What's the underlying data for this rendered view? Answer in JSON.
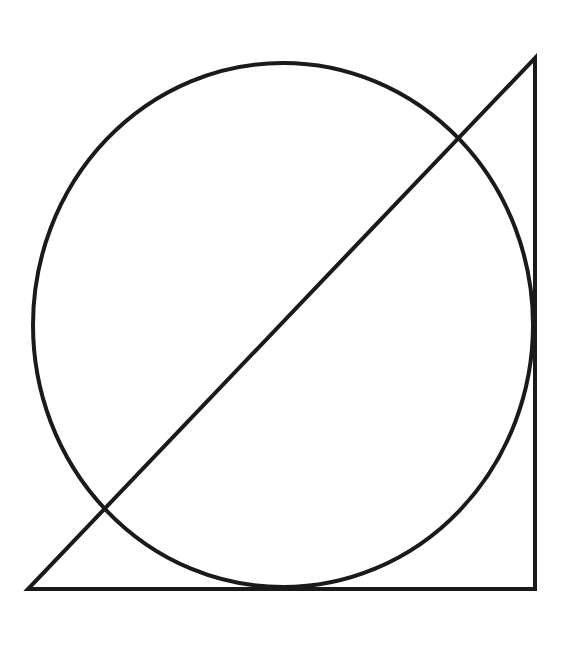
{
  "canvas": {
    "width": 579,
    "height": 670,
    "background_color": "#ffffff"
  },
  "figure": {
    "stroke_color": "#1a1a1a",
    "stroke_width": 4,
    "fill": "none"
  },
  "chart_data": {
    "type": "diagram",
    "title": "",
    "shapes": [
      {
        "name": "triangle",
        "kind": "polyline",
        "closed": true,
        "points": [
          [
            28,
            589
          ],
          [
            535,
            589
          ],
          [
            535,
            58
          ]
        ],
        "stroke": "#1a1a1a",
        "stroke_width": 4,
        "fill": "none",
        "description": "Right triangle: bottom-left vertex, bottom-right vertex (right angle), top-right apex"
      },
      {
        "name": "circle",
        "kind": "ellipse",
        "cx": 283,
        "cy": 325,
        "rx": 250,
        "ry": 262,
        "stroke": "#1a1a1a",
        "stroke_width": 4,
        "fill": "none",
        "description": "Large circle tangent to the bottom edge of the triangle, crossing the hypotenuse twice"
      }
    ],
    "vertices": {
      "bottom_left": [
        28,
        589
      ],
      "bottom_right": [
        535,
        589
      ],
      "top_right": [
        535,
        58
      ]
    },
    "circle_extents": {
      "left": [
        34,
        325
      ],
      "right": [
        533,
        325
      ],
      "top": [
        283,
        63
      ],
      "bottom": [
        283,
        587
      ]
    },
    "intersections": {
      "hypotenuse_circle_lower_left": [
        105,
        513
      ],
      "hypotenuse_circle_upper_right": [
        460,
        142
      ]
    }
  }
}
